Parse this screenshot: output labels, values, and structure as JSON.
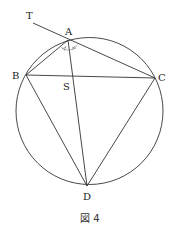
{
  "figure": {
    "caption": "図 4",
    "points": {
      "T": {
        "label": "T",
        "x": 33,
        "y": 23
      },
      "A": {
        "label": "A",
        "x": 68,
        "y": 40
      },
      "B": {
        "label": "B",
        "x": 26,
        "y": 75
      },
      "C": {
        "label": "C",
        "x": 155,
        "y": 78
      },
      "D": {
        "label": "D",
        "x": 87,
        "y": 186
      },
      "S": {
        "label": "S",
        "x": 73,
        "y": 76
      }
    },
    "circle": {
      "cx": 89.5,
      "cy": 111,
      "r": 73.5
    },
    "segments": [
      "TC",
      "AB",
      "AD",
      "BC",
      "BD",
      "CD"
    ],
    "angle_marks": [
      "BAD",
      "DAC"
    ],
    "stroke_color": "#333333"
  }
}
